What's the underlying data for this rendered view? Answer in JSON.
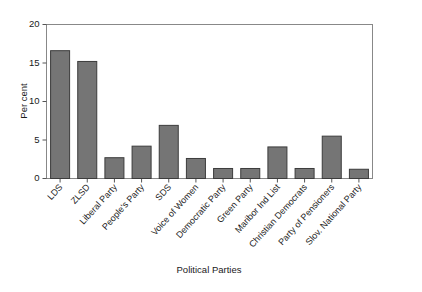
{
  "chart_data": {
    "type": "bar",
    "title": "",
    "subtitle": "",
    "xlabel": "Political Parties",
    "ylabel": "Per cent",
    "ylim": [
      0,
      20
    ],
    "yticks": [
      0,
      5,
      10,
      15,
      20
    ],
    "ytick_labels": [
      "0",
      "5",
      "10",
      "15",
      "20"
    ],
    "grid": false,
    "legend": false,
    "legend_position": "none",
    "bar_color": "#757575",
    "bar_edge_color": "#3c3c3c",
    "frame_color": "#808080",
    "categories": [
      "LDS",
      "ZLSD",
      "Liberal Party",
      "People's Party",
      "SDS",
      "Voice of Women",
      "Democratic Party",
      "Green Party",
      "Maribor Ind List",
      "Christian Democrats",
      "Party of Pensioners",
      "Slov. National Party"
    ],
    "values": [
      16.6,
      15.2,
      2.7,
      4.2,
      6.9,
      2.6,
      1.3,
      1.3,
      4.1,
      1.3,
      5.5,
      1.2
    ]
  },
  "axis": {
    "y_label": "Per cent",
    "x_label": "Political Parties",
    "y_ticks": [
      "0",
      "5",
      "10",
      "15",
      "20"
    ]
  }
}
